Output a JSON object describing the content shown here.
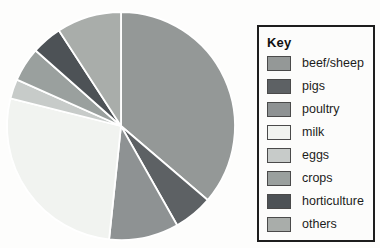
{
  "figure": {
    "background_color": "#fdfdfc"
  },
  "legend": {
    "title": "Key",
    "border_color": "#1d1d1d",
    "position": "right"
  },
  "chart_data": {
    "type": "pie",
    "title": "",
    "direction": "clockwise",
    "start_angle": "12 o'clock",
    "separator_color": "#ffffff",
    "legend_position": "right",
    "slices": [
      {
        "label": "beef/sheep",
        "color": "#949897",
        "angle_deg": 130.5,
        "value_percent": 36.3
      },
      {
        "label": "pigs",
        "color": "#5d6164",
        "angle_deg": 20.0,
        "value_percent": 5.6
      },
      {
        "label": "poultry",
        "color": "#8e9293",
        "angle_deg": 35.5,
        "value_percent": 9.9
      },
      {
        "label": "milk",
        "color": "#f1f3f0",
        "angle_deg": 98.0,
        "value_percent": 27.2
      },
      {
        "label": "eggs",
        "color": "#c7cbc9",
        "angle_deg": 10.0,
        "value_percent": 2.8
      },
      {
        "label": "crops",
        "color": "#9aa09e",
        "angle_deg": 17.5,
        "value_percent": 4.9
      },
      {
        "label": "horticulture",
        "color": "#4d5256",
        "angle_deg": 15.5,
        "value_percent": 4.3
      },
      {
        "label": "others",
        "color": "#a9adaa",
        "angle_deg": 33.0,
        "value_percent": 9.2
      }
    ]
  }
}
